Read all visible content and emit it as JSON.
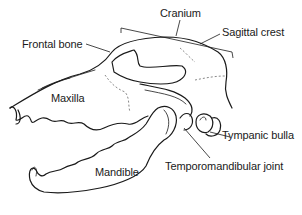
{
  "diagram": {
    "labels": [
      {
        "id": "cranium",
        "text": "Cranium"
      },
      {
        "id": "sagittal_crest",
        "text": "Sagittal crest"
      },
      {
        "id": "frontal_bone",
        "text": "Frontal bone"
      },
      {
        "id": "maxilla",
        "text": "Maxilla"
      },
      {
        "id": "tympanic_bulla",
        "text": "Tympanic bulla"
      },
      {
        "id": "temporomandibular_joint",
        "text": "Temporomandibular joint"
      },
      {
        "id": "mandible",
        "text": "Mandible"
      }
    ],
    "colors": {
      "line": "#1a1a1a",
      "background": "#ffffff"
    }
  }
}
